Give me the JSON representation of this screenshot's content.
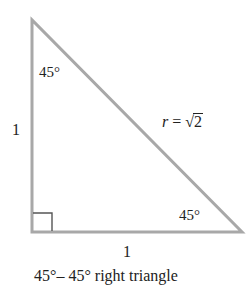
{
  "diagram": {
    "type": "right-triangle",
    "colors": {
      "stroke": "#a8a8a8",
      "text": "#222222",
      "right_angle_mark": "#555555"
    },
    "vertices": {
      "top": [
        32,
        20
      ],
      "bottom_left": [
        32,
        232
      ],
      "bottom_right": [
        242,
        232
      ]
    },
    "angles": {
      "top_label": "45°",
      "bottom_right_label": "45°",
      "bottom_left": "right-angle"
    },
    "sides": {
      "vertical_label": "1",
      "horizontal_label": "1",
      "hypotenuse_var": "r",
      "hypotenuse_eq": " = ",
      "hypotenuse_radical": "√",
      "hypotenuse_radicand": "2"
    },
    "caption": "45°– 45° right triangle"
  }
}
